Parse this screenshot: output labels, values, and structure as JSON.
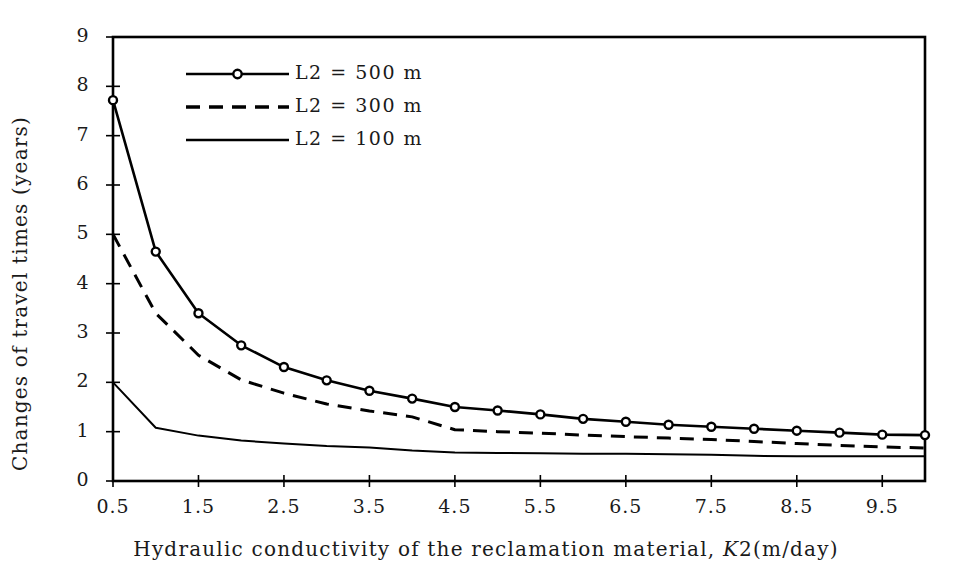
{
  "chart_data": {
    "type": "line",
    "title": "",
    "xlabel": "Hydraulic conductivity of the reclamation material,  K2(m/day)",
    "ylabel": "Changes of travel times (years)",
    "xlim": [
      0.5,
      10.0
    ],
    "ylim": [
      0,
      9
    ],
    "grid": false,
    "legend_position": "top-left-inside",
    "x_tick_labels": [
      "0.5",
      "1.5",
      "2.5",
      "3.5",
      "4.5",
      "5.5",
      "6.5",
      "7.5",
      "8.5",
      "9.5"
    ],
    "x_tick_values": [
      0.5,
      1.5,
      2.5,
      3.5,
      4.5,
      5.5,
      6.5,
      7.5,
      8.5,
      9.5
    ],
    "y_tick_labels": [
      "0",
      "1",
      "2",
      "3",
      "4",
      "5",
      "6",
      "7",
      "8",
      "9"
    ],
    "y_tick_values": [
      0,
      1,
      2,
      3,
      4,
      5,
      6,
      7,
      8,
      9
    ],
    "x": [
      0.5,
      1.0,
      1.5,
      2.0,
      2.5,
      3.0,
      3.5,
      4.0,
      4.5,
      5.0,
      5.5,
      6.0,
      6.5,
      7.0,
      7.5,
      8.0,
      8.5,
      9.0,
      9.5,
      10.0
    ],
    "series": [
      {
        "name": "L2 = 500 m",
        "style": "solid-marker",
        "marker": "open-circle",
        "values": [
          7.72,
          4.65,
          3.4,
          2.75,
          2.31,
          2.04,
          1.83,
          1.67,
          1.5,
          1.43,
          1.35,
          1.26,
          1.2,
          1.14,
          1.1,
          1.06,
          1.02,
          0.98,
          0.94,
          0.93
        ]
      },
      {
        "name": "L2 = 300 m",
        "style": "dashed",
        "marker": "none",
        "values": [
          5.0,
          3.4,
          2.55,
          2.05,
          1.78,
          1.56,
          1.42,
          1.3,
          1.04,
          1.0,
          0.97,
          0.93,
          0.9,
          0.87,
          0.84,
          0.8,
          0.76,
          0.72,
          0.69,
          0.67
        ]
      },
      {
        "name": "L2 = 100 m",
        "style": "solid",
        "marker": "none",
        "values": [
          2.0,
          1.08,
          0.92,
          0.82,
          0.76,
          0.71,
          0.68,
          0.62,
          0.58,
          0.57,
          0.56,
          0.55,
          0.55,
          0.54,
          0.53,
          0.51,
          0.5,
          0.5,
          0.5,
          0.5
        ]
      }
    ],
    "legend": [
      {
        "label": "L2 = 500 m",
        "style": "solid-marker"
      },
      {
        "label": "L2 = 300 m",
        "style": "dashed"
      },
      {
        "label": "L2 = 100 m",
        "style": "solid"
      }
    ],
    "colors": {
      "line": "#000000",
      "axis": "#000000",
      "text": "#1a1a1a",
      "background": "#ffffff"
    }
  },
  "legend_labels": {
    "l500": "L2 = 500 m",
    "l300": "L2 = 300 m",
    "l100": "L2 = 100 m"
  },
  "axes": {
    "x_title_main": "Hydraulic conductivity of the reclamation material, ",
    "x_title_k": "K",
    "x_title_tail": "2(m/day)",
    "y_title": "Changes of travel times (years)"
  }
}
